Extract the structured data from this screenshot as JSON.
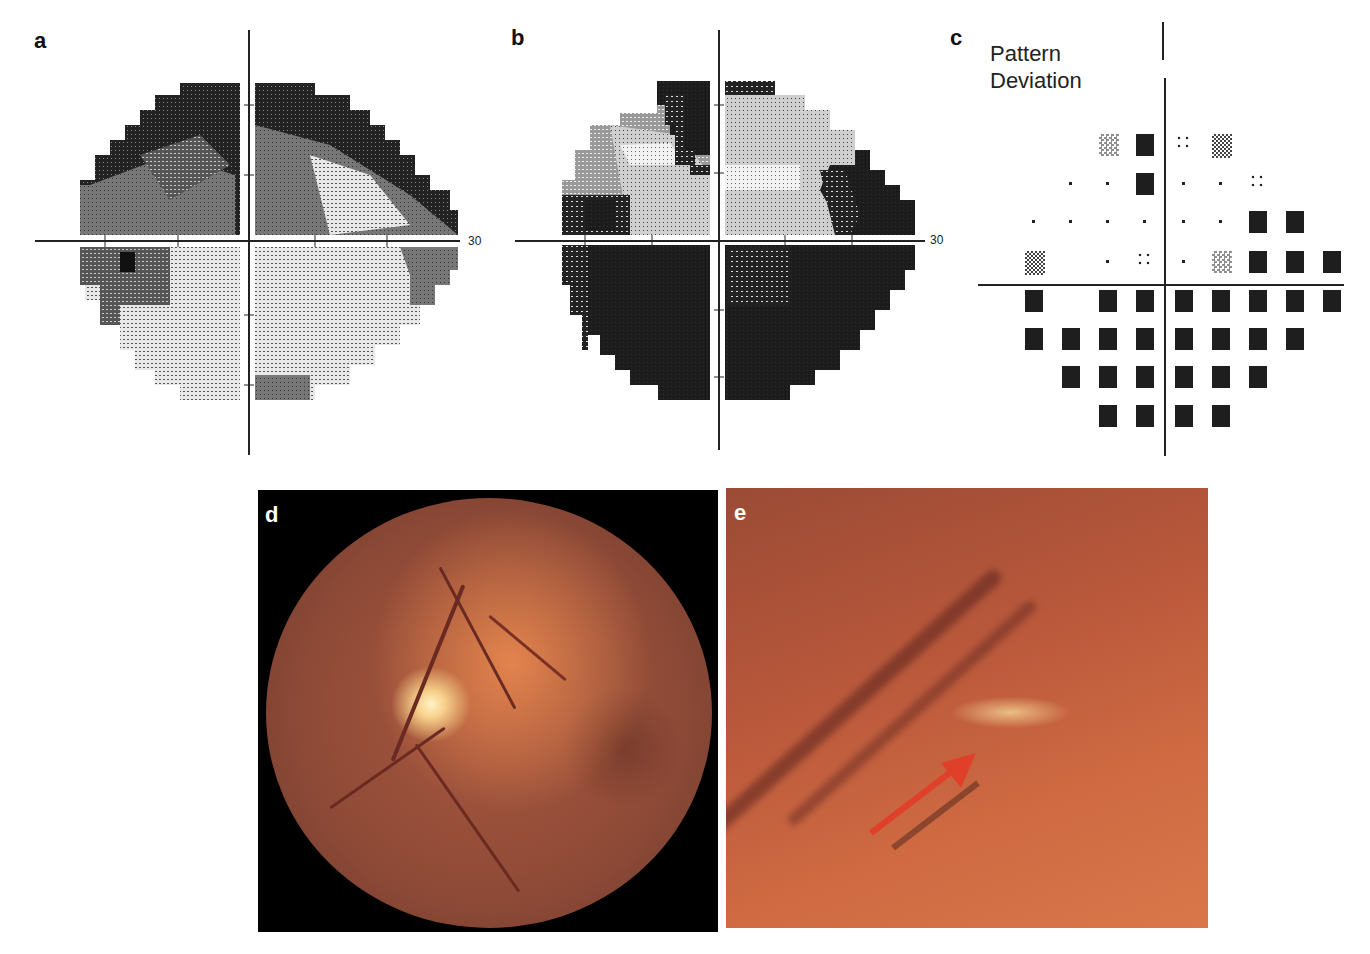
{
  "figure": {
    "panels": [
      {
        "id": "a",
        "label": "a",
        "type": "visual-field-greyscale",
        "axis_max_label": "30"
      },
      {
        "id": "b",
        "label": "b",
        "type": "visual-field-greyscale",
        "axis_max_label": "30"
      },
      {
        "id": "c",
        "label": "c",
        "type": "pattern-deviation-plot",
        "title_line1": "Pattern",
        "title_line2": "Deviation"
      },
      {
        "id": "d",
        "label": "d",
        "type": "fundus-photograph"
      },
      {
        "id": "e",
        "label": "e",
        "type": "fundus-photograph-magnified",
        "annotation": "red-arrow"
      }
    ]
  },
  "pattern_deviation": {
    "rows": [
      [
        "",
        "",
        "",
        "sparse",
        "black",
        "quad",
        "checker",
        "",
        "",
        ""
      ],
      [
        "",
        "",
        "dot",
        "dot",
        "black",
        "dot",
        "dot",
        "quad",
        "",
        ""
      ],
      [
        "",
        "dot",
        "dot",
        "dot",
        "dot",
        "dot",
        "dot",
        "black",
        "black",
        ""
      ],
      [
        "",
        "checker",
        "",
        "dot",
        "quad",
        "dot",
        "sparse",
        "black",
        "black",
        "black"
      ],
      [
        "",
        "black",
        "",
        "black",
        "black",
        "black",
        "black",
        "black",
        "black",
        "black"
      ],
      [
        "",
        "black",
        "black",
        "black",
        "black",
        "black",
        "black",
        "black",
        "black",
        ""
      ],
      [
        "",
        "",
        "black",
        "black",
        "black",
        "black",
        "black",
        "black",
        "",
        ""
      ],
      [
        "",
        "",
        "",
        "black",
        "black",
        "black",
        "black",
        "",
        "",
        ""
      ]
    ]
  },
  "colors": {
    "dark": "#1e1e1e",
    "annotation_arrow": "#e0402a"
  }
}
